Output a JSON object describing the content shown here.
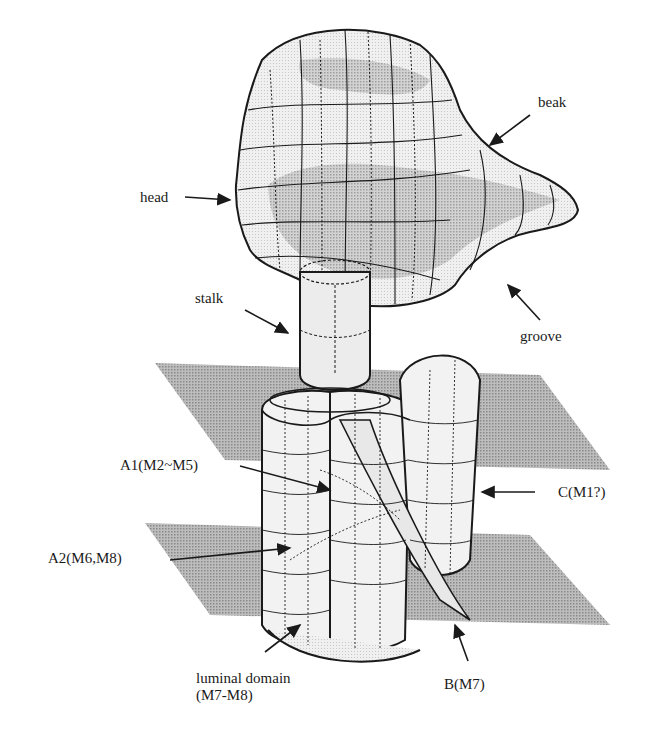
{
  "figure": {
    "type": "3D surface model of membrane protein",
    "labels": {
      "beak": "beak",
      "head": "head",
      "stalk": "stalk",
      "groove": "groove",
      "a1": "A1(M2~M5)",
      "a2": "A2(M6,M8)",
      "c": "C(M1?)",
      "luminal_line1": "luminal domain",
      "luminal_line2": "(M7-M8)",
      "b": "B(M7)"
    },
    "colors": {
      "ink": "#1a1a1a",
      "membrane_fill": "#a8a8a8",
      "surface_fill": "#e6e6e6",
      "shaded_region": "#c4c4c4"
    }
  }
}
